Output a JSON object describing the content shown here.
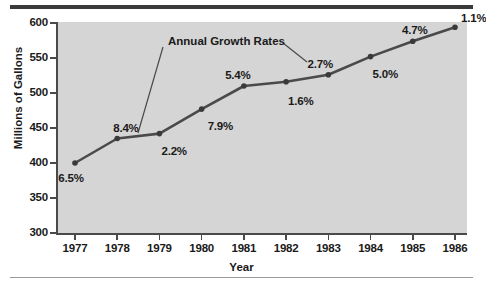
{
  "chart_data": {
    "type": "line",
    "title": "",
    "xlabel": "Year",
    "ylabel": "Millions of Gallons",
    "categories": [
      "1977",
      "1978",
      "1979",
      "1980",
      "1981",
      "1982",
      "1983",
      "1984",
      "1985",
      "1986"
    ],
    "values": [
      400,
      435,
      442,
      477,
      510,
      516,
      526,
      552,
      574,
      594
    ],
    "ylim": [
      300,
      600
    ],
    "yticks": [
      "300",
      "350",
      "400",
      "450",
      "500",
      "550",
      "600"
    ],
    "ytick_values": [
      300,
      350,
      400,
      450,
      500,
      550,
      600
    ],
    "grid": false,
    "legend": "none",
    "annotation": "Annual Growth Rates",
    "point_labels": [
      "6.5%",
      "8.4%",
      "2.2%",
      "7.9%",
      "5.4%",
      "1.6%",
      "2.7%",
      "5.0%",
      "4.7%",
      "1.1%"
    ],
    "growth_rates": [
      6.5,
      8.4,
      2.2,
      7.9,
      5.4,
      1.6,
      2.7,
      5.0,
      4.7,
      1.1
    ],
    "colors": {
      "plot_background": "#d5d5d5",
      "page_background": "#ffffff",
      "line": "#4a4a4a",
      "marker": "#3a3a3a",
      "axis": "#4a4a4a",
      "text": "#1a1a1a",
      "rule_top": "#3a3a3a",
      "rule_bottom": "#9a9a9a"
    }
  }
}
